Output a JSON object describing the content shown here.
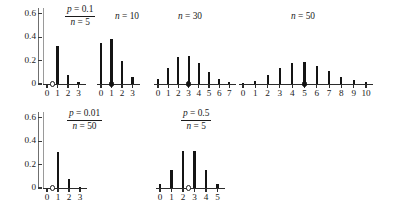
{
  "figure": {
    "title": "",
    "axis": {
      "y_ticks": [
        "0.6",
        "0.4",
        "0.2",
        "0"
      ],
      "y_values": [
        0.6,
        0.4,
        0.2,
        0.0
      ],
      "y_max": 0.65
    }
  },
  "panels": [
    {
      "id": "p01-n5",
      "row": "top",
      "annotation_type": "fraction",
      "annotation_num": "p = 0.1",
      "annotation_den": "n = 5",
      "p": 0.1,
      "n": 5,
      "x_ticks": [
        "0",
        "1",
        "2",
        "3"
      ],
      "x_values": [
        0,
        1,
        2,
        3
      ],
      "values": [
        0.0,
        0.328,
        0.073,
        0.021
      ],
      "marker": {
        "x": 0.5,
        "style": "open"
      }
    },
    {
      "id": "p01-n10",
      "row": "top",
      "annotation_type": "simple",
      "annotation_text": "n = 10",
      "p": 0.1,
      "n": 10,
      "x_ticks": [
        "0",
        "1",
        "2",
        "3"
      ],
      "x_values": [
        0,
        1,
        2,
        3
      ],
      "values": [
        0.349,
        0.387,
        0.194,
        0.057
      ],
      "marker": {
        "x": 1,
        "style": "filled"
      }
    },
    {
      "id": "p01-n30",
      "row": "top",
      "annotation_type": "simple",
      "annotation_text": "n = 30",
      "p": 0.1,
      "n": 30,
      "x_ticks": [
        "0",
        "1",
        "2",
        "3",
        "4",
        "5",
        "6",
        "7"
      ],
      "x_values": [
        0,
        1,
        2,
        3,
        4,
        5,
        6,
        7
      ],
      "values": [
        0.042,
        0.141,
        0.228,
        0.236,
        0.177,
        0.102,
        0.047,
        0.018
      ],
      "marker": {
        "x": 3,
        "style": "filled"
      }
    },
    {
      "id": "p01-n50",
      "row": "top",
      "annotation_type": "simple",
      "annotation_text": "n = 50",
      "p": 0.1,
      "n": 50,
      "x_ticks": [
        "0",
        "1",
        "2",
        "3",
        "4",
        "5",
        "6",
        "7",
        "8",
        "9",
        "10"
      ],
      "x_values": [
        0,
        1,
        2,
        3,
        4,
        5,
        6,
        7,
        8,
        9,
        10
      ],
      "values": [
        0.005,
        0.029,
        0.078,
        0.139,
        0.181,
        0.185,
        0.154,
        0.108,
        0.064,
        0.033,
        0.015
      ],
      "marker": {
        "x": 5,
        "style": "filled"
      }
    },
    {
      "id": "p001-n50",
      "row": "bottom",
      "annotation_type": "fraction",
      "annotation_num": "p = 0.01",
      "annotation_den": "n = 50",
      "p": 0.01,
      "n": 50,
      "x_ticks": [
        "0",
        "1",
        "2",
        "3"
      ],
      "x_values": [
        0,
        1,
        2,
        3
      ],
      "values": [
        0.0,
        0.306,
        0.076,
        0.012
      ],
      "marker": {
        "x": 0.5,
        "style": "open"
      }
    },
    {
      "id": "p05-n5",
      "row": "bottom",
      "annotation_type": "fraction",
      "annotation_num": "p = 0.5",
      "annotation_den": "n = 5",
      "p": 0.5,
      "n": 5,
      "x_ticks": [
        "0",
        "1",
        "2",
        "3",
        "4",
        "5"
      ],
      "x_values": [
        0,
        1,
        2,
        3,
        4,
        5
      ],
      "values": [
        0.031,
        0.156,
        0.313,
        0.313,
        0.156,
        0.031
      ],
      "marker": {
        "x": 2.5,
        "style": "open"
      }
    }
  ],
  "chart_data": {
    "type": "bar",
    "xlabel": "",
    "ylabel": "",
    "ylim": [
      0,
      0.65
    ],
    "yticks": [
      0,
      0.2,
      0.4,
      0.6
    ],
    "grid": false,
    "legend": "none",
    "layout": "2 rows x (4 panels top, 2 panels bottom)",
    "panels": [
      {
        "label": "p = 0.1 / n = 5",
        "p": 0.1,
        "n": 5,
        "categories": [
          0,
          1,
          2,
          3
        ],
        "values": [
          0.0,
          0.328,
          0.073,
          0.021
        ],
        "mean_marker": 0.5,
        "marker_style": "open-circle"
      },
      {
        "label": "n = 10",
        "p": 0.1,
        "n": 10,
        "categories": [
          0,
          1,
          2,
          3
        ],
        "values": [
          0.349,
          0.387,
          0.194,
          0.057
        ],
        "mean_marker": 1,
        "marker_style": "filled-circle"
      },
      {
        "label": "n = 30",
        "p": 0.1,
        "n": 30,
        "categories": [
          0,
          1,
          2,
          3,
          4,
          5,
          6,
          7
        ],
        "values": [
          0.042,
          0.141,
          0.228,
          0.236,
          0.177,
          0.102,
          0.047,
          0.018
        ],
        "mean_marker": 3,
        "marker_style": "filled-circle"
      },
      {
        "label": "n = 50",
        "p": 0.1,
        "n": 50,
        "categories": [
          0,
          1,
          2,
          3,
          4,
          5,
          6,
          7,
          8,
          9,
          10
        ],
        "values": [
          0.005,
          0.029,
          0.078,
          0.139,
          0.181,
          0.185,
          0.154,
          0.108,
          0.064,
          0.033,
          0.015
        ],
        "mean_marker": 5,
        "marker_style": "filled-circle"
      },
      {
        "label": "p = 0.01 / n = 50",
        "p": 0.01,
        "n": 50,
        "categories": [
          0,
          1,
          2,
          3
        ],
        "values": [
          0.0,
          0.306,
          0.076,
          0.012
        ],
        "mean_marker": 0.5,
        "marker_style": "open-circle"
      },
      {
        "label": "p = 0.5 / n = 5",
        "p": 0.5,
        "n": 5,
        "categories": [
          0,
          1,
          2,
          3,
          4,
          5
        ],
        "values": [
          0.031,
          0.156,
          0.313,
          0.313,
          0.156,
          0.031
        ],
        "mean_marker": 2.5,
        "marker_style": "open-circle"
      }
    ]
  }
}
